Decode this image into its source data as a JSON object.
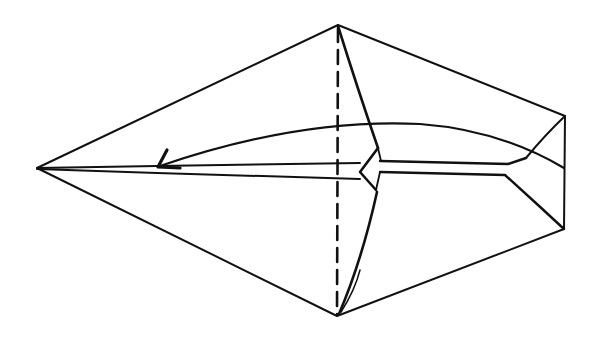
{
  "diagram": {
    "type": "origami-fold-diagram",
    "caption": "",
    "ink_color": "#111111",
    "background_color": "#ffffff",
    "elements": [
      {
        "name": "outline",
        "description": "kite-shaped outer outline with pointed left tip"
      },
      {
        "name": "valley-fold-line",
        "description": "vertical dashed fold line through top and bottom vertices"
      },
      {
        "name": "fold-arrow",
        "description": "curved arrow from right side pointing left toward the tip"
      },
      {
        "name": "center-flap",
        "description": "narrow central strip with diamond notch"
      },
      {
        "name": "crease-lines",
        "description": "inner crease lines at right end"
      }
    ]
  }
}
